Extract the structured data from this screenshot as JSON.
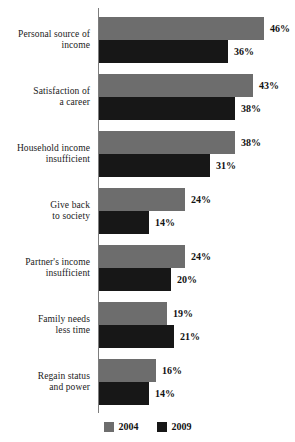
{
  "chart_data": {
    "type": "bar",
    "orientation": "horizontal",
    "title": "",
    "subtitle": "",
    "xlabel": "",
    "ylabel": "",
    "xlim": [
      0,
      46
    ],
    "grid": false,
    "legend_position": "bottom",
    "value_suffix": "%",
    "categories": [
      "Personal source of income",
      "Satisfaction of a career",
      "Household income insufficient",
      "Give back to society",
      "Partner's income insufficient",
      "Family needs less time",
      "Regain status and power"
    ],
    "category_lines": [
      [
        "Personal source of",
        "income"
      ],
      [
        "Satisfaction of",
        "a career"
      ],
      [
        "Household income",
        "insufficient"
      ],
      [
        "Give back",
        "to society"
      ],
      [
        "Partner's income",
        "insufficient"
      ],
      [
        "Family needs",
        "less time"
      ],
      [
        "Regain status",
        "and power"
      ]
    ],
    "series": [
      {
        "name": "2004",
        "color": "#6d6d6d",
        "values": [
          46,
          43,
          38,
          24,
          24,
          19,
          16
        ],
        "labels": [
          "46%",
          "43%",
          "38%",
          "24%",
          "24%",
          "19%",
          "16%"
        ]
      },
      {
        "name": "2009",
        "color": "#171717",
        "values": [
          36,
          38,
          31,
          14,
          20,
          21,
          14
        ],
        "labels": [
          "36%",
          "38%",
          "31%",
          "14%",
          "20%",
          "21%",
          "14%"
        ]
      }
    ]
  },
  "legend": {
    "items": [
      {
        "label": "2004",
        "color": "#6d6d6d"
      },
      {
        "label": "2009",
        "color": "#171717"
      }
    ]
  }
}
